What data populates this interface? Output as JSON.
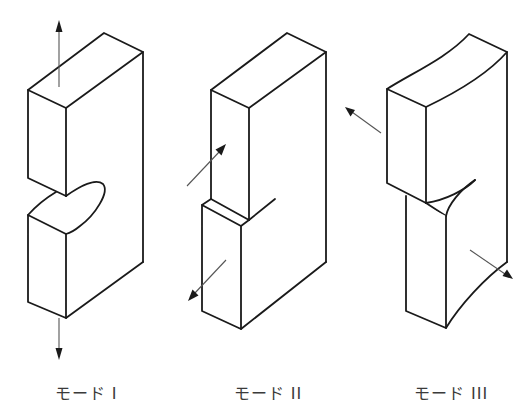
{
  "figure": {
    "colors": {
      "line": "#1a1a1a",
      "arrow_shaft": "#555555",
      "label_text": "#3a3a3a",
      "background": "#ffffff"
    },
    "modes": [
      {
        "id": "mode-1",
        "label": "モード I",
        "description": "Opening mode: tensile load perpendicular to crack plane",
        "arrows": [
          "up",
          "down"
        ]
      },
      {
        "id": "mode-2",
        "label": "モード II",
        "description": "Sliding mode: in-plane shear",
        "arrows": [
          "up-right",
          "down-left"
        ]
      },
      {
        "id": "mode-3",
        "label": "モード III",
        "description": "Tearing mode: out-of-plane shear",
        "arrows": [
          "up-left",
          "down-right"
        ]
      }
    ]
  }
}
